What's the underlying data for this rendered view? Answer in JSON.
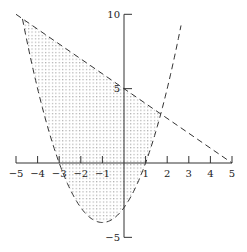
{
  "chart_data": {
    "type": "line",
    "title": "",
    "xlabel": "",
    "ylabel": "",
    "xlim": [
      -5,
      5
    ],
    "ylim": [
      -5,
      10
    ],
    "grid": false,
    "x_ticks": [
      -5,
      -4,
      -3,
      -2,
      -1,
      1,
      2,
      3,
      4,
      5
    ],
    "x_tick_labels": [
      "−5",
      "−4",
      "−3",
      "−2",
      "−1",
      "1",
      "2",
      "3",
      "4",
      "5"
    ],
    "y_ticks": [
      -5,
      5,
      10
    ],
    "y_tick_labels": [
      "−5",
      "5",
      "10"
    ],
    "series": [
      {
        "name": "line",
        "equation": "y = 5 - x",
        "style": "dashed",
        "x": [
          -5,
          5
        ],
        "y": [
          10,
          0
        ]
      },
      {
        "name": "parabola",
        "equation": "y = x^2 + 2x - 3",
        "style": "dashed",
        "x_range": [
          -4.7,
          2.64
        ],
        "vertex": [
          -1,
          -4
        ],
        "roots": [
          -3,
          1
        ],
        "y_intercept": -3
      }
    ],
    "shaded_region": {
      "description": "x^2 + 2x - 3 <= y <= 5 - x",
      "fill": "dotted",
      "x_from": -4.7,
      "x_to": 1.7
    }
  },
  "axes": {
    "origin_px": [
      124,
      163
    ],
    "x_scale_px": 21.6,
    "y_scale_px": 14.87,
    "color": "#333333",
    "dot_color": "#8a8a8a"
  }
}
